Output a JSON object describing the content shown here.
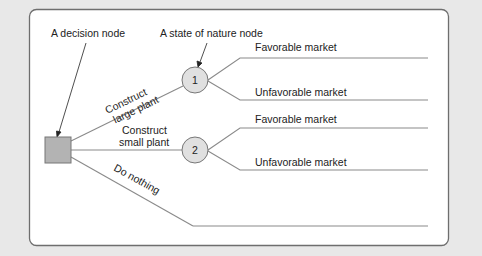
{
  "diagram": {
    "type": "decision-tree",
    "callouts": {
      "decision_node": "A decision node",
      "state_of_nature_node": "A state of nature node"
    },
    "decision_node": {
      "shape": "square",
      "fill": "#b3b3b3"
    },
    "chance_nodes": [
      {
        "id": "1",
        "label": "1"
      },
      {
        "id": "2",
        "label": "2"
      }
    ],
    "alternatives": [
      {
        "line1": "Construct",
        "line2": "large plant",
        "leads_to": "1"
      },
      {
        "line1": "Construct",
        "line2": "small plant",
        "leads_to": "2"
      },
      {
        "line1": "Do nothing",
        "leads_to": null
      }
    ],
    "outcomes": [
      {
        "node": "1",
        "label": "Favorable market"
      },
      {
        "node": "1",
        "label": "Unfavorable market"
      },
      {
        "node": "2",
        "label": "Favorable market"
      },
      {
        "node": "2",
        "label": "Unfavorable market"
      }
    ],
    "colors": {
      "background": "#e8e8e8",
      "panel": "#ffffff",
      "panel_border": "#6e6e6e",
      "line": "#8a8a8a",
      "node_fill": "#e0e0e0",
      "text": "#222222"
    }
  }
}
